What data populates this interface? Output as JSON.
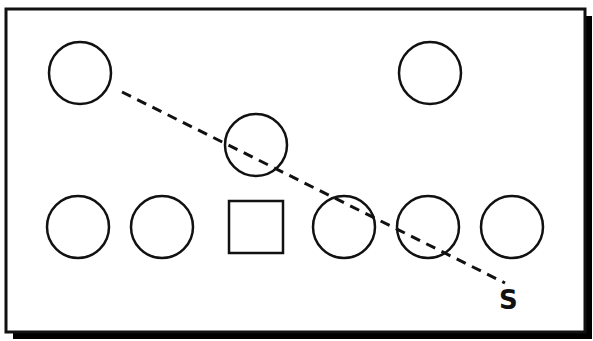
{
  "diagram": {
    "title": "",
    "colors": {
      "background": "#ffffff",
      "stroke": "#111111",
      "shadow": "#000000"
    },
    "frame": {
      "x": 6,
      "y": 9,
      "width": 579,
      "height": 323,
      "shadow_offset": 7
    },
    "circles": [
      {
        "id": "top-left",
        "cx": 80,
        "cy": 73,
        "r": 31
      },
      {
        "id": "top-right",
        "cx": 430,
        "cy": 73,
        "r": 31
      },
      {
        "id": "middle",
        "cx": 256,
        "cy": 145,
        "r": 31
      },
      {
        "id": "bottom-1",
        "cx": 78,
        "cy": 227,
        "r": 31
      },
      {
        "id": "bottom-2",
        "cx": 162,
        "cy": 227,
        "r": 31
      },
      {
        "id": "bottom-4",
        "cx": 344,
        "cy": 227,
        "r": 31
      },
      {
        "id": "bottom-5",
        "cx": 428,
        "cy": 227,
        "r": 31
      },
      {
        "id": "bottom-6",
        "cx": 512,
        "cy": 227,
        "r": 31
      }
    ],
    "squares": [
      {
        "id": "bottom-3",
        "x": 229,
        "y": 201,
        "width": 54,
        "height": 52
      }
    ],
    "dashed_line": {
      "x1": 122,
      "y1": 92,
      "x2": 505,
      "y2": 283,
      "dash": "10,7"
    },
    "labels": [
      {
        "id": "start-label",
        "text": "S",
        "x": 499,
        "y": 309
      }
    ]
  }
}
